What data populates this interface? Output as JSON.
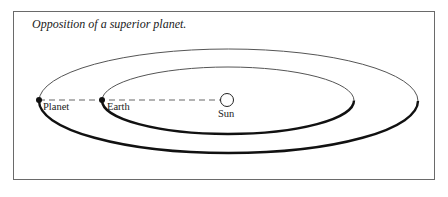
{
  "figure": {
    "title": "Opposition of a superior planet.",
    "labels": {
      "planet": "Planet",
      "earth": "Earth",
      "sun": "Sun"
    },
    "colors": {
      "stroke": "#111111",
      "thin_stroke": "#555555",
      "frame": "#6a6a6a",
      "background": "#ffffff"
    }
  }
}
